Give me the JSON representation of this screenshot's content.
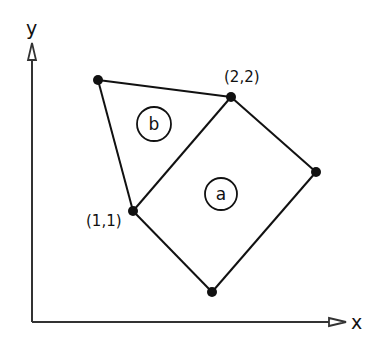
{
  "axes": {
    "x_label": "x",
    "y_label": "y"
  },
  "points": [
    {
      "id": "p_top_left",
      "label": ""
    },
    {
      "id": "p22",
      "label": "(2,2)"
    },
    {
      "id": "p_right",
      "label": ""
    },
    {
      "id": "p11",
      "label": "(1,1)"
    },
    {
      "id": "p_bottom",
      "label": ""
    }
  ],
  "regions": {
    "a": {
      "label": "a"
    },
    "b": {
      "label": "b"
    }
  },
  "colors": {
    "stroke": "#111111",
    "axis": "#333333"
  }
}
